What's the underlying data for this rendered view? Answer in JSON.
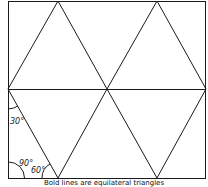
{
  "diagram": {
    "caption": "Bold lines are equilateral triangles",
    "angle_labels": {
      "top_left": "30°",
      "bottom_left": "90°",
      "bottom_inner": "60°"
    },
    "colors": {
      "stroke": "#1a1a1a",
      "background": "#ffffff"
    }
  }
}
